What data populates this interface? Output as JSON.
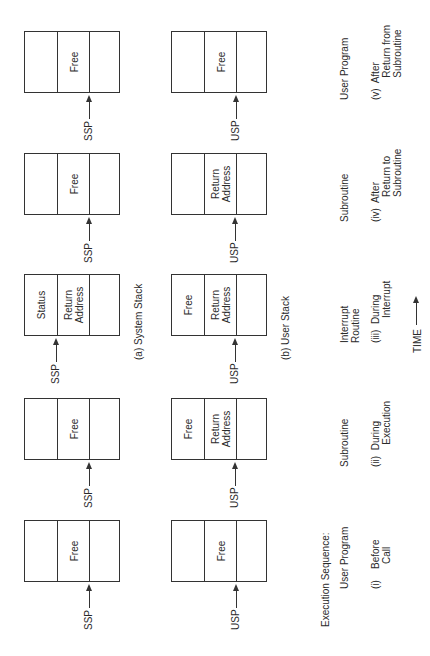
{
  "title": "Execution Sequence:",
  "stack_labels": {
    "system": "(a)  System Stack",
    "user": "(b)  User Stack"
  },
  "time_label": "TIME",
  "pointers": {
    "system": "SSP",
    "user": "USP"
  },
  "stages": [
    {
      "id": "i",
      "routine": "User Program",
      "caption": "(i)    Before\n         Call",
      "system_stack": [
        "",
        "Free",
        ""
      ],
      "system_pointer_slot": 2,
      "user_stack": [
        "",
        "Free",
        ""
      ],
      "user_pointer_slot": 2
    },
    {
      "id": "ii",
      "routine": "Subroutine",
      "caption": "(ii)  During\n        Execution",
      "system_stack": [
        "",
        "Free",
        ""
      ],
      "system_pointer_slot": 2,
      "user_stack": [
        "Free",
        "Return\nAddress",
        ""
      ],
      "user_pointer_slot": 1
    },
    {
      "id": "iii",
      "routine": "Interrupt\nRoutine",
      "caption": "(iii)  During\n         Interrupt",
      "system_stack": [
        "Status",
        "Return\nAddress",
        ""
      ],
      "system_pointer_slot": 0,
      "user_stack": [
        "Free",
        "Return\nAddress",
        ""
      ],
      "user_pointer_slot": 1
    },
    {
      "id": "iv",
      "routine": "Subroutine",
      "caption": "(iv)  After\n         Return to\n         Subroutine",
      "system_stack": [
        "",
        "Free",
        ""
      ],
      "system_pointer_slot": 2,
      "user_stack": [
        "",
        "Return\nAddress",
        ""
      ],
      "user_pointer_slot": 1
    },
    {
      "id": "v",
      "routine": "User Program",
      "caption": "(v)  After\n        Return from\n        Subroutine",
      "system_stack": [
        "",
        "Free",
        ""
      ],
      "system_pointer_slot": 2,
      "user_stack": [
        "",
        "Free",
        ""
      ],
      "user_pointer_slot": 2
    }
  ]
}
